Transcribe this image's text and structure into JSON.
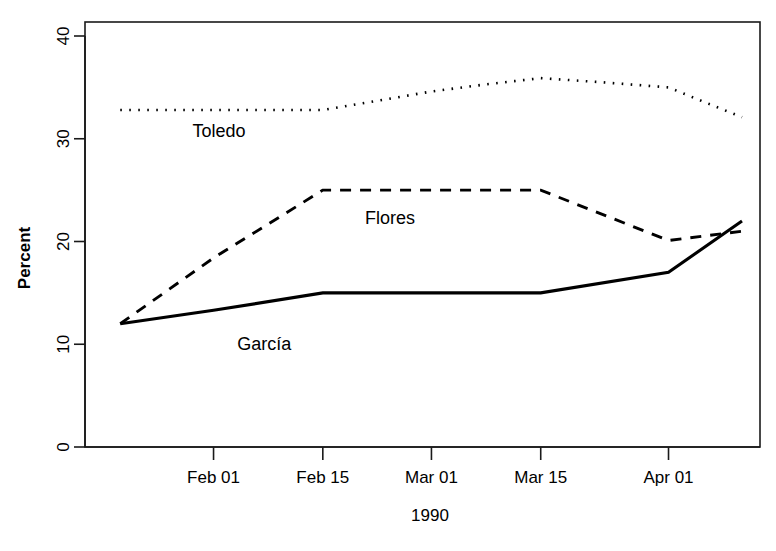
{
  "chart_data": {
    "type": "line",
    "title": "",
    "subtitle": "",
    "xlabel": "1990",
    "ylabel": "Percent",
    "ylim": [
      0,
      41
    ],
    "xlim": [
      0,
      100
    ],
    "grid": false,
    "legend_position": "inline-labels",
    "y_ticks": [
      "0",
      "10",
      "20",
      "30",
      "40"
    ],
    "y_tick_values": [
      0,
      10,
      20,
      30,
      40
    ],
    "x_ticks": [
      "Feb 01",
      "Feb 15",
      "Mar 01",
      "Mar 15",
      "Apr 01"
    ],
    "x_tick_values": [
      17.3,
      34.4,
      51.4,
      68.5,
      88.5
    ],
    "annotations": [
      {
        "text": "Toledo",
        "x": 14.0,
        "y": 30.2
      },
      {
        "text": "Flores",
        "x": 41.0,
        "y": 21.7
      },
      {
        "text": "García",
        "x": 21.0,
        "y": 9.4
      }
    ],
    "series": [
      {
        "name": "Toledo",
        "style": "dotted",
        "x": [
          2.7,
          17.3,
          34.4,
          42.0,
          51.4,
          60.0,
          68.5,
          78.0,
          88.5,
          94.0,
          100.0
        ],
        "values": [
          32.8,
          32.8,
          32.8,
          33.6,
          34.6,
          35.3,
          35.9,
          35.5,
          35.0,
          33.6,
          32.1
        ]
      },
      {
        "name": "Flores",
        "style": "dashed",
        "x": [
          2.7,
          17.3,
          34.4,
          51.4,
          68.5,
          88.5,
          100.0
        ],
        "values": [
          12.0,
          18.4,
          25.0,
          25.0,
          25.0,
          20.1,
          21.0
        ]
      },
      {
        "name": "García",
        "style": "solid",
        "x": [
          2.7,
          17.3,
          34.4,
          51.4,
          68.5,
          88.5,
          100.0
        ],
        "values": [
          12.0,
          13.3,
          15.0,
          15.0,
          15.0,
          17.0,
          22.0
        ]
      }
    ]
  },
  "axes": {
    "y_title": "Percent",
    "x_title": "1990"
  },
  "colors": {
    "foreground": "#000000",
    "axis": "#1a1a1a",
    "background": "#ffffff"
  }
}
